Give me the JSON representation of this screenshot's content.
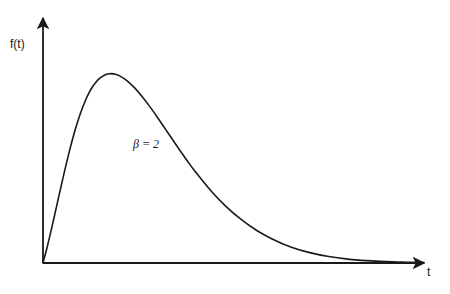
{
  "chart_data": {
    "type": "line",
    "title": "",
    "subtitle": "",
    "xlabel": "t",
    "ylabel": "f(t)",
    "xlim": [
      0,
      10
    ],
    "ylim": [
      0,
      1.25
    ],
    "grid": false,
    "legend": null,
    "annotations": [
      {
        "text": "β = 2",
        "x": 2.6,
        "y": 1.02,
        "style": "italic-serif"
      }
    ],
    "axes": {
      "x_axis_arrow": true,
      "y_axis_arrow": true,
      "ticks_x": [],
      "ticks_y": [],
      "tick_labels_x": [],
      "tick_labels_y": []
    },
    "series": [
      {
        "name": "β = 2",
        "color": "#1a1a1a",
        "x": [
          0.0,
          0.1,
          0.2,
          0.3,
          0.4,
          0.5,
          0.6,
          0.7,
          0.8,
          0.9,
          1.0,
          1.1,
          1.2,
          1.3,
          1.4,
          1.5,
          1.6,
          1.7,
          1.8,
          1.9,
          2.0,
          2.2,
          2.4,
          2.6,
          2.8,
          3.0,
          3.2,
          3.4,
          3.6,
          3.8,
          4.0,
          4.4,
          4.8,
          5.2,
          5.6,
          6.0,
          6.5,
          7.0,
          7.5,
          8.0,
          8.5,
          9.0,
          9.5,
          10.0
        ],
        "y": [
          0.0,
          0.074,
          0.155,
          0.24,
          0.327,
          0.413,
          0.497,
          0.576,
          0.649,
          0.715,
          0.773,
          0.823,
          0.865,
          0.899,
          0.925,
          0.944,
          0.957,
          0.964,
          0.966,
          0.963,
          0.956,
          0.931,
          0.895,
          0.85,
          0.799,
          0.744,
          0.687,
          0.63,
          0.573,
          0.518,
          0.465,
          0.37,
          0.289,
          0.222,
          0.167,
          0.124,
          0.082,
          0.053,
          0.033,
          0.02,
          0.012,
          0.007,
          0.004,
          0.002
        ]
      }
    ]
  },
  "labels": {
    "y_axis": "f(t)",
    "x_axis": "t",
    "beta_annotation": "β = 2"
  },
  "colors": {
    "line": "#1a1a1a",
    "axis": "#1a1a1a",
    "background": "#ffffff"
  }
}
